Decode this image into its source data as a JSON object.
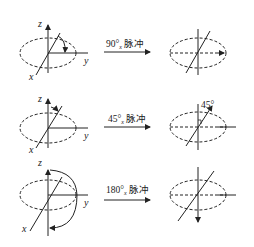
{
  "diagram": {
    "rows": [
      {
        "pulse_label": "90°",
        "pulse_sub": "x",
        "pulse_text": "脉冲",
        "axes": {
          "z": "z",
          "x": "x",
          "y": "y"
        },
        "after_annotation": ""
      },
      {
        "pulse_label": "45°",
        "pulse_sub": "x",
        "pulse_text": "脉冲",
        "axes": {
          "z": "z",
          "x": "x",
          "y": "y"
        },
        "after_annotation": "45°"
      },
      {
        "pulse_label": "180°",
        "pulse_sub": "x",
        "pulse_text": "脉冲",
        "axes": {
          "z": "z",
          "x": "x",
          "y": "y"
        },
        "after_annotation": ""
      }
    ],
    "stroke_color": "#222222"
  }
}
